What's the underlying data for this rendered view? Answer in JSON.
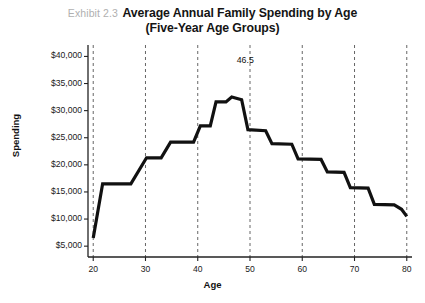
{
  "figure": {
    "exhibit_label": "Exhibit 2.3",
    "title_line1": "Average Annual Family Spending by Age",
    "title_line2": "(Five-Year Age Groups)"
  },
  "chart_data": {
    "type": "line",
    "title": "Average Annual Family Spending by Age (Five-Year Age Groups)",
    "xlabel": "Age",
    "ylabel": "Spending",
    "xlim": [
      19,
      81
    ],
    "ylim": [
      3000,
      41000
    ],
    "xticks": [
      20,
      30,
      40,
      50,
      60,
      70,
      80
    ],
    "xtick_labels": [
      "20",
      "30",
      "40",
      "50",
      "60",
      "70",
      "80"
    ],
    "yticks": [
      5000,
      10000,
      15000,
      20000,
      25000,
      30000,
      35000,
      40000
    ],
    "ytick_labels": [
      "$5,000",
      "$10,000",
      "$15,000",
      "$20,000",
      "$25,000",
      "$30,000",
      "$35,000",
      "$40,000"
    ],
    "grid": "vertical-dashed-at-xticks",
    "legend": "none",
    "line_color": "#111111",
    "line_width": 3.2,
    "drawstyle": "steps",
    "x": [
      20,
      21.5,
      25,
      28,
      31,
      34.5,
      38,
      41,
      44,
      46.5,
      49,
      52.5,
      56,
      59,
      62.5,
      66,
      69,
      72.5,
      76,
      79,
      80
    ],
    "values": [
      6500,
      16500,
      16600,
      21300,
      24200,
      27000,
      30200,
      32100,
      37500,
      37200,
      38000,
      37600,
      31900,
      30100,
      26700,
      24900,
      22300,
      21700,
      17300,
      13300,
      13200
    ],
    "series": [
      {
        "name": "Average annual family spending",
        "points": [
          {
            "age": 20.0,
            "spending": 6500
          },
          {
            "age": 21.8,
            "spending": 16500
          },
          {
            "age": 27.2,
            "spending": 16500
          },
          {
            "age": 30.2,
            "spending": 21300
          },
          {
            "age": 33.0,
            "spending": 21300
          },
          {
            "age": 34.8,
            "spending": 24200
          },
          {
            "age": 39.2,
            "spending": 24200
          },
          {
            "age": 40.5,
            "spending": 27200
          },
          {
            "age": 42.4,
            "spending": 27200
          },
          {
            "age": 43.5,
            "spending": 31600
          },
          {
            "age": 45.4,
            "spending": 31600
          },
          {
            "age": 46.5,
            "spending": 32500
          },
          {
            "age": 48.4,
            "spending": 32000
          },
          {
            "age": 49.6,
            "spending": 26500
          },
          {
            "age": 53.0,
            "spending": 26300
          },
          {
            "age": 54.2,
            "spending": 23900
          },
          {
            "age": 58.0,
            "spending": 23800
          },
          {
            "age": 59.2,
            "spending": 21100
          },
          {
            "age": 63.6,
            "spending": 21000
          },
          {
            "age": 64.8,
            "spending": 18700
          },
          {
            "age": 68.0,
            "spending": 18600
          },
          {
            "age": 69.2,
            "spending": 15800
          },
          {
            "age": 72.6,
            "spending": 15700
          },
          {
            "age": 73.8,
            "spending": 12700
          },
          {
            "age": 77.6,
            "spending": 12600
          },
          {
            "age": 79.0,
            "spending": 11800
          },
          {
            "age": 80.0,
            "spending": 10500
          }
        ]
      }
    ],
    "annotations": [
      {
        "text": "46.5",
        "age": 46.5,
        "description": "peak age group label"
      }
    ]
  }
}
